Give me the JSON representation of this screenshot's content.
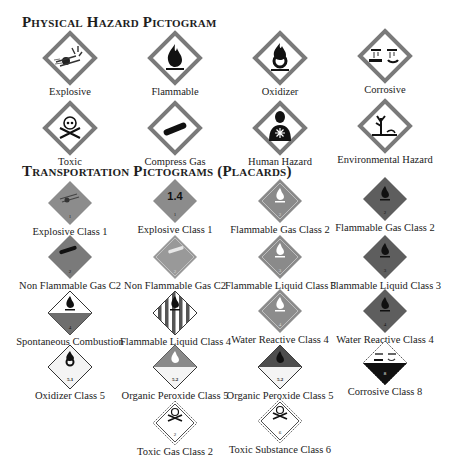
{
  "physical": {
    "title": "Physical Hazard Pictogram",
    "items": [
      {
        "label": "Explosive",
        "icon": "exploding-bomb-icon"
      },
      {
        "label": "Flammable",
        "icon": "flame-icon"
      },
      {
        "label": "Oxidizer",
        "icon": "flame-over-circle-icon"
      },
      {
        "label": "Corrosive",
        "icon": "corrosion-icon"
      },
      {
        "label": "Toxic",
        "icon": "skull-crossbones-icon"
      },
      {
        "label": "Compress Gas",
        "icon": "gas-cylinder-icon"
      },
      {
        "label": "Human Hazard",
        "icon": "health-hazard-icon"
      },
      {
        "label": "Environmental Hazard",
        "icon": "environment-icon"
      }
    ]
  },
  "transport": {
    "title": "Transportation Pictograms (Placards)",
    "items": [
      {
        "label": "Explosive Class 1",
        "icon": "exploding-bomb-icon",
        "text": ""
      },
      {
        "label": "Explosive Class 1",
        "icon": "number-1-4-icon",
        "text": "1.4"
      },
      {
        "label": "Flammable Gas Class 2",
        "icon": "flame-icon",
        "text": ""
      },
      {
        "label": "Flammable Gas Class 2",
        "icon": "flame-icon",
        "text": ""
      },
      {
        "label": "Non Flammable Gas C2",
        "icon": "gas-cylinder-icon",
        "text": ""
      },
      {
        "label": "Non Flammable Gas C2",
        "icon": "gas-cylinder-icon",
        "text": ""
      },
      {
        "label": "Flammable Liquid Class 3",
        "icon": "flame-icon",
        "text": ""
      },
      {
        "label": "Flammable Liquid Class 3",
        "icon": "flame-icon",
        "text": ""
      },
      {
        "label": "Spontaneous Combustion",
        "icon": "flame-icon",
        "text": ""
      },
      {
        "label": "Flammable Liquid Class 4",
        "icon": "flame-icon",
        "text": ""
      },
      {
        "label": "Water Reactive Class 4",
        "icon": "flame-icon",
        "text": ""
      },
      {
        "label": "Water Reactive Class 4",
        "icon": "flame-icon",
        "text": ""
      },
      {
        "label": "Oxidizer Class 5",
        "icon": "flame-over-circle-icon",
        "text": "5.1"
      },
      {
        "label": "Organic Peroxide Class 5",
        "icon": "flame-icon",
        "text": "5.2"
      },
      {
        "label": "Organic Peroxide Class 5",
        "icon": "flame-icon",
        "text": "5.2"
      },
      {
        "label": "Corrosive Class 8",
        "icon": "corrosion-icon",
        "text": "8"
      },
      {
        "label": "Toxic Gas Class 2",
        "icon": "skull-crossbones-icon",
        "text": "2"
      },
      {
        "label": "Toxic Substance Class 6",
        "icon": "skull-crossbones-icon",
        "text": "6"
      }
    ]
  },
  "colors": {
    "ghs_border": "#7a7a7a",
    "placard_gray": "#8a8a8a",
    "placard_dark": "#5f5f5f",
    "placard_light": "#a8a8a8",
    "symbol": "#111111"
  }
}
